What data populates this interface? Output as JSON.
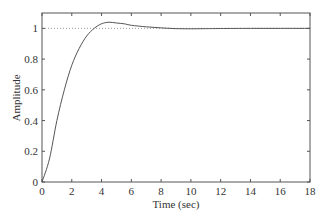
{
  "chart_data": {
    "type": "line",
    "title": "",
    "xlabel": "Time (sec)",
    "ylabel": "Amplitude",
    "xlim": [
      0,
      18
    ],
    "ylim": [
      0,
      1.1
    ],
    "xticks": [
      0,
      2,
      4,
      6,
      8,
      10,
      12,
      14,
      16,
      18
    ],
    "yticks": [
      0,
      0.2,
      0.4,
      0.6,
      0.8,
      1
    ],
    "xtick_labels": [
      "0",
      "2",
      "4",
      "6",
      "8",
      "10",
      "12",
      "14",
      "16",
      "18"
    ],
    "ytick_labels": [
      "0",
      "0.2",
      "0.4",
      "0.6",
      "0.8",
      "1"
    ],
    "grid": false,
    "reference_line": {
      "y": 1,
      "style": "dotted"
    },
    "series": [
      {
        "name": "Step response",
        "x": [
          0,
          0.5,
          1,
          1.5,
          2,
          2.5,
          3,
          3.5,
          4,
          4.5,
          5,
          5.5,
          6,
          7,
          8,
          9,
          10,
          11,
          12,
          14,
          16,
          18
        ],
        "values": [
          0,
          0.15,
          0.4,
          0.6,
          0.76,
          0.87,
          0.95,
          1.0,
          1.03,
          1.04,
          1.035,
          1.03,
          1.02,
          1.01,
          1.003,
          0.998,
          0.997,
          0.998,
          0.999,
          1.0,
          1.0,
          1.0
        ]
      }
    ]
  }
}
